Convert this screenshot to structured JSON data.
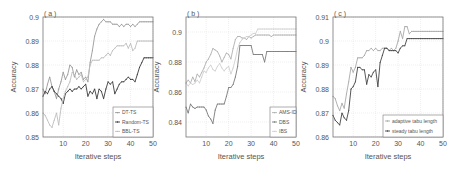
{
  "chart_data": [
    {
      "type": "line",
      "panel_label": "( a )",
      "title": "",
      "xlabel": "Iterative steps",
      "ylabel": "Accuracy",
      "xlim": [
        1,
        50
      ],
      "ylim": [
        0.85,
        0.9
      ],
      "xticks": [
        10,
        20,
        30,
        40,
        50
      ],
      "yticks": [
        0.85,
        0.86,
        0.87,
        0.88,
        0.89,
        0.9
      ],
      "ytick_labels": [
        "0.85",
        "0.86",
        "0.87",
        "0.88",
        "0.89",
        "0.9"
      ],
      "grid": true,
      "legend_position": "lower right",
      "x": [
        1,
        2,
        3,
        4,
        5,
        6,
        7,
        8,
        9,
        10,
        11,
        12,
        13,
        14,
        15,
        16,
        17,
        18,
        19,
        20,
        21,
        22,
        23,
        24,
        25,
        26,
        27,
        28,
        29,
        30,
        31,
        32,
        33,
        34,
        35,
        36,
        37,
        38,
        39,
        40,
        41,
        42,
        43,
        44,
        45,
        46,
        47,
        48,
        49,
        50
      ],
      "series": [
        {
          "name": "DT-TS",
          "color": "#9a9a9a",
          "marker": "dot",
          "values": [
            0.87,
            0.868,
            0.872,
            0.875,
            0.871,
            0.869,
            0.866,
            0.87,
            0.873,
            0.877,
            0.874,
            0.876,
            0.88,
            0.879,
            0.875,
            0.878,
            0.876,
            0.877,
            0.874,
            0.875,
            0.873,
            0.881,
            0.886,
            0.892,
            0.895,
            0.897,
            0.898,
            0.899,
            0.898,
            0.898,
            0.898,
            0.897,
            0.897,
            0.897,
            0.896,
            0.897,
            0.896,
            0.897,
            0.897,
            0.896,
            0.897,
            0.896,
            0.897,
            0.898,
            0.898,
            0.898,
            0.898,
            0.898,
            0.898,
            0.898
          ]
        },
        {
          "name": "Random-TS",
          "color": "#3a3a3a",
          "marker": "dot",
          "values": [
            0.867,
            0.869,
            0.868,
            0.87,
            0.871,
            0.869,
            0.868,
            0.867,
            0.866,
            0.864,
            0.868,
            0.869,
            0.87,
            0.869,
            0.87,
            0.87,
            0.871,
            0.87,
            0.871,
            0.872,
            0.867,
            0.869,
            0.868,
            0.87,
            0.866,
            0.87,
            0.869,
            0.866,
            0.87,
            0.873,
            0.872,
            0.873,
            0.868,
            0.87,
            0.872,
            0.873,
            0.873,
            0.874,
            0.875,
            0.874,
            0.874,
            0.873,
            0.876,
            0.879,
            0.881,
            0.883,
            0.883,
            0.883,
            0.883,
            0.883
          ]
        },
        {
          "name": "BBL-TS",
          "color": "#bdbdbd",
          "marker": "dot",
          "values": [
            0.86,
            0.859,
            0.857,
            0.855,
            0.854,
            0.857,
            0.86,
            0.855,
            0.862,
            0.866,
            0.869,
            0.871,
            0.873,
            0.877,
            0.876,
            0.874,
            0.875,
            0.876,
            0.873,
            0.874,
            0.875,
            0.88,
            0.882,
            0.882,
            0.882,
            0.882,
            0.883,
            0.883,
            0.884,
            0.885,
            0.884,
            0.886,
            0.887,
            0.888,
            0.888,
            0.888,
            0.888,
            0.889,
            0.887,
            0.889,
            0.886,
            0.887,
            0.89,
            0.89,
            0.89,
            0.89,
            0.89,
            0.89,
            0.89,
            0.89
          ]
        }
      ]
    },
    {
      "type": "line",
      "panel_label": "( b )",
      "title": "",
      "xlabel": "Iterative steps",
      "ylabel": "Accuracy",
      "xlim": [
        1,
        50
      ],
      "ylim": [
        0.83,
        0.91
      ],
      "xticks": [
        10,
        20,
        30,
        40,
        50
      ],
      "yticks": [
        0.84,
        0.86,
        0.88,
        0.9
      ],
      "ytick_labels": [
        "0.84",
        "0.86",
        "0.88",
        "0.9"
      ],
      "grid": true,
      "legend_position": "lower right",
      "x": [
        1,
        2,
        3,
        4,
        5,
        6,
        7,
        8,
        9,
        10,
        11,
        12,
        13,
        14,
        15,
        16,
        17,
        18,
        19,
        20,
        21,
        22,
        23,
        24,
        25,
        26,
        27,
        28,
        29,
        30,
        31,
        32,
        33,
        34,
        35,
        36,
        37,
        38,
        39,
        40,
        41,
        42,
        43,
        44,
        45,
        46,
        47,
        48,
        49,
        50
      ],
      "series": [
        {
          "name": "AMS-ID",
          "color": "#b0b0b0",
          "marker": "dot",
          "values": [
            0.866,
            0.868,
            0.866,
            0.87,
            0.867,
            0.872,
            0.87,
            0.873,
            0.876,
            0.88,
            0.882,
            0.885,
            0.889,
            0.888,
            0.887,
            0.884,
            0.88,
            0.883,
            0.886,
            0.885,
            0.882,
            0.889,
            0.895,
            0.897,
            0.897,
            0.896,
            0.896,
            0.895,
            0.897,
            0.896,
            0.897,
            0.898,
            0.898,
            0.898,
            0.898,
            0.898,
            0.898,
            0.898,
            0.897,
            0.898,
            0.898,
            0.898,
            0.898,
            0.898,
            0.898,
            0.898,
            0.898,
            0.898,
            0.898,
            0.898
          ]
        },
        {
          "name": "DBS",
          "color": "#7a7a7a",
          "marker": "dot",
          "values": [
            0.85,
            0.846,
            0.852,
            0.85,
            0.849,
            0.85,
            0.85,
            0.85,
            0.85,
            0.848,
            0.844,
            0.842,
            0.839,
            0.848,
            0.852,
            0.852,
            0.852,
            0.852,
            0.857,
            0.863,
            0.863,
            0.865,
            0.87,
            0.877,
            0.891,
            0.891,
            0.891,
            0.891,
            0.891,
            0.891,
            0.885,
            0.885,
            0.885,
            0.885,
            0.885,
            0.88,
            0.887,
            0.887,
            0.887,
            0.887,
            0.887,
            0.887,
            0.887,
            0.887,
            0.887,
            0.887,
            0.887,
            0.887,
            0.887,
            0.887
          ]
        },
        {
          "name": "IBS",
          "color": "#d0d0d0",
          "marker": "dot",
          "values": [
            0.866,
            0.864,
            0.866,
            0.865,
            0.866,
            0.868,
            0.866,
            0.87,
            0.874,
            0.873,
            0.876,
            0.878,
            0.875,
            0.874,
            0.877,
            0.879,
            0.876,
            0.874,
            0.876,
            0.877,
            0.872,
            0.876,
            0.882,
            0.889,
            0.893,
            0.895,
            0.896,
            0.897,
            0.897,
            0.898,
            0.899,
            0.899,
            0.902,
            0.902,
            0.902,
            0.902,
            0.902,
            0.902,
            0.902,
            0.902,
            0.902,
            0.902,
            0.902,
            0.902,
            0.902,
            0.902,
            0.902,
            0.902,
            0.902,
            0.902
          ]
        }
      ]
    },
    {
      "type": "line",
      "panel_label": "( c )",
      "title": "",
      "xlabel": "Iterative steps",
      "ylabel": "Accuracy",
      "xlim": [
        1,
        50
      ],
      "ylim": [
        0.86,
        0.91
      ],
      "xticks": [
        10,
        20,
        30,
        40,
        50
      ],
      "yticks": [
        0.86,
        0.87,
        0.88,
        0.89,
        0.9,
        0.91
      ],
      "ytick_labels": [
        "0.86",
        "0.87",
        "0.88",
        "0.89",
        "0.9",
        "0.91"
      ],
      "grid": true,
      "legend_position": "lower right",
      "x": [
        1,
        2,
        3,
        4,
        5,
        6,
        7,
        8,
        9,
        10,
        11,
        12,
        13,
        14,
        15,
        16,
        17,
        18,
        19,
        20,
        21,
        22,
        23,
        24,
        25,
        26,
        27,
        28,
        29,
        30,
        31,
        32,
        33,
        34,
        35,
        36,
        37,
        38,
        39,
        40,
        41,
        42,
        43,
        44,
        45,
        46,
        47,
        48,
        49,
        50
      ],
      "series": [
        {
          "name": "adaptive tabu length",
          "color": "#a8a8a8",
          "marker": "dot",
          "values": [
            0.877,
            0.876,
            0.873,
            0.871,
            0.874,
            0.872,
            0.878,
            0.883,
            0.889,
            0.887,
            0.889,
            0.893,
            0.893,
            0.893,
            0.894,
            0.896,
            0.896,
            0.897,
            0.896,
            0.897,
            0.896,
            0.896,
            0.897,
            0.897,
            0.897,
            0.896,
            0.897,
            0.896,
            0.897,
            0.9,
            0.904,
            0.901,
            0.906,
            0.906,
            0.903,
            0.904,
            0.904,
            0.904,
            0.904,
            0.904,
            0.904,
            0.904,
            0.904,
            0.904,
            0.904,
            0.904,
            0.904,
            0.904,
            0.904,
            0.904
          ]
        },
        {
          "name": "steady tabu length",
          "color": "#444444",
          "marker": "dot",
          "values": [
            0.869,
            0.867,
            0.866,
            0.865,
            0.87,
            0.868,
            0.867,
            0.871,
            0.88,
            0.881,
            0.883,
            0.889,
            0.889,
            0.888,
            0.888,
            0.882,
            0.886,
            0.885,
            0.887,
            0.888,
            0.881,
            0.891,
            0.894,
            0.897,
            0.897,
            0.896,
            0.896,
            0.896,
            0.896,
            0.895,
            0.897,
            0.898,
            0.898,
            0.901,
            0.901,
            0.901,
            0.901,
            0.901,
            0.901,
            0.901,
            0.901,
            0.901,
            0.901,
            0.901,
            0.901,
            0.901,
            0.901,
            0.901,
            0.901,
            0.901
          ]
        }
      ]
    }
  ],
  "figure": {
    "panels": [
      {
        "label": "( a )",
        "xlabel": "Iterative steps",
        "ylabel": "Accuracy",
        "legend": [
          "DT-TS",
          "Random-TS",
          "BBL-TS"
        ]
      },
      {
        "label": "( b )",
        "xlabel": "Iterative steps",
        "ylabel": "Accuracy",
        "legend": [
          "AMS-ID",
          "DBS",
          "IBS"
        ]
      },
      {
        "label": "( c )",
        "xlabel": "Iterative steps",
        "ylabel": "Accuracy",
        "legend": [
          "adaptive tabu length",
          "steady tabu length"
        ]
      }
    ]
  }
}
